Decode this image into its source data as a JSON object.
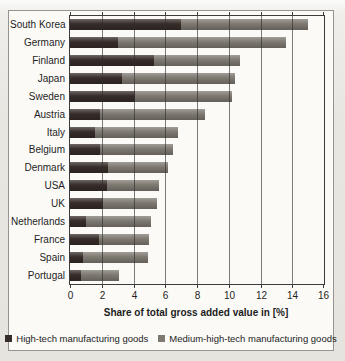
{
  "chart_data": {
    "type": "bar",
    "orientation": "horizontal",
    "stacked": true,
    "title": "",
    "xlabel": "Share of total gross added value in [%]",
    "ylabel": "",
    "xlim": [
      0,
      16
    ],
    "xticks": [
      0,
      2,
      4,
      6,
      8,
      10,
      12,
      14,
      16
    ],
    "grid": true,
    "legend_position": "bottom",
    "categories": [
      "South Korea",
      "Germany",
      "Finland",
      "Japan",
      "Sweden",
      "Austria",
      "Italy",
      "Belgium",
      "Denmark",
      "USA",
      "UK",
      "Netherlands",
      "France",
      "Spain",
      "Portugal"
    ],
    "series": [
      {
        "name": "High-tech manufacturing goods",
        "color": "#362c29",
        "values": [
          7.0,
          3.0,
          5.3,
          3.3,
          4.1,
          1.9,
          1.6,
          1.9,
          2.4,
          2.3,
          2.1,
          1.0,
          1.8,
          0.8,
          0.7
        ]
      },
      {
        "name": "Medium-high-tech manufacturing goods",
        "color": "#7d7870",
        "values": [
          8.0,
          10.6,
          5.4,
          7.1,
          6.1,
          6.6,
          5.2,
          4.6,
          3.8,
          3.3,
          3.4,
          4.1,
          3.2,
          4.1,
          2.4
        ]
      }
    ],
    "colors": {
      "gridline": "#2d2d2d",
      "plot_border": "#3c3c3c",
      "frame_border": "#97948f",
      "background": "#fbfaf7"
    }
  }
}
